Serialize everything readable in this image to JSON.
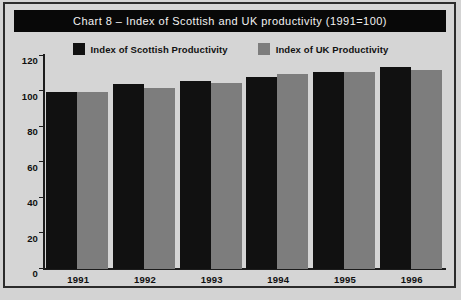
{
  "figure": {
    "title": "Chart 8 – Index of Scottish and UK productivity (1991=100)",
    "title_bar_color": "#080808",
    "title_text_color": "#f2f2f2",
    "background_color": "#d5d5d5",
    "border_color": "#2b2b2b",
    "footnote": ""
  },
  "legend": {
    "position": "top",
    "entries": [
      {
        "label": "Index of Scottish Productivity",
        "color": "#111111",
        "swatch_name": "legend-swatch-scottish"
      },
      {
        "label": "Index of UK Productivity",
        "color": "#7d7d7d",
        "swatch_name": "legend-swatch-uk"
      }
    ]
  },
  "chart_data": {
    "type": "bar",
    "title": "Chart 8 – Index of Scottish and UK productivity (1991=100)",
    "xlabel": "",
    "ylabel": "",
    "categories": [
      "1991",
      "1992",
      "1993",
      "1994",
      "1995",
      "1996"
    ],
    "series": [
      {
        "name": "Index of Scottish Productivity",
        "color": "#111111",
        "values": [
          100,
          104,
          106,
          108,
          111,
          114
        ]
      },
      {
        "name": "Index of UK Productivity",
        "color": "#7d7d7d",
        "values": [
          100,
          102,
          105,
          110,
          111,
          112
        ]
      }
    ],
    "ylim": [
      0,
      120
    ],
    "yticks": [
      0,
      20,
      40,
      60,
      80,
      100,
      120
    ],
    "ytick_labels": [
      "0",
      "20",
      "40",
      "60",
      "80",
      "100",
      "120"
    ],
    "grid": false,
    "legend_position": "top-center"
  }
}
